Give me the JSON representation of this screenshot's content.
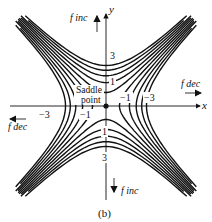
{
  "figure": {
    "caption": "(b)",
    "axes": {
      "x_label": "x",
      "y_label": "y"
    },
    "center_label_line1": "Saddle",
    "center_label_line2": "point",
    "direction_labels": {
      "top": "f inc",
      "bottom": "f inc",
      "right": "f dec",
      "left": "f dec"
    },
    "contour_labels": {
      "y_pos_3": "3",
      "y_pos_1": "1",
      "y_neg_1": "1",
      "y_neg_3": "3",
      "x_pos_1": "−1",
      "x_pos_3": "−3",
      "x_neg_1": "−1",
      "x_neg_3": "−3"
    },
    "function_description": "Contour map of saddle surface; f increases along y-axis, decreases along x-axis",
    "contour_levels": [
      -9,
      -7,
      -5,
      -3,
      -1,
      1,
      3,
      5,
      7,
      9
    ],
    "colors": {
      "ink": "#111111",
      "background": "#ffffff"
    }
  }
}
